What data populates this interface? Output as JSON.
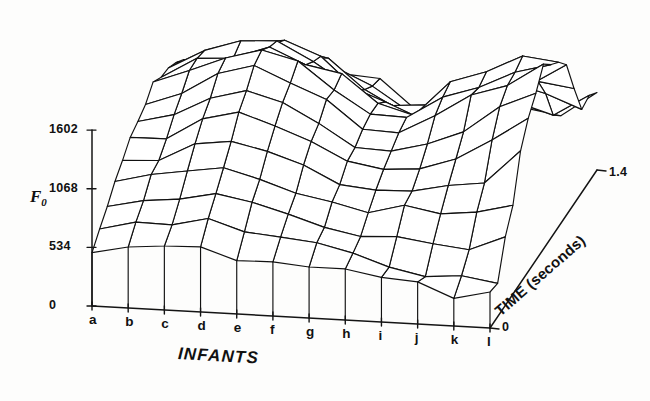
{
  "figure": {
    "type": "3d-wireframe-surface",
    "background_color": "#fdfdfc",
    "line_color": "#111111"
  },
  "axes": {
    "vertical": {
      "title": "F",
      "title_sub": "0",
      "title_full": "F0",
      "ticks": [
        "1602",
        "1068",
        "534",
        "0"
      ],
      "tick_values": [
        1602,
        1068,
        534,
        0
      ],
      "range": [
        0,
        1602
      ]
    },
    "depth": {
      "title": "TIME (seconds)",
      "ticks": [
        "0",
        "1.4"
      ],
      "tick_values": [
        0,
        1.4
      ],
      "range": [
        0,
        1.4
      ]
    },
    "horizontal": {
      "title": "INFANTS",
      "ticks": [
        "a",
        "b",
        "c",
        "d",
        "e",
        "f",
        "g",
        "h",
        "i",
        "j",
        "k",
        "l"
      ]
    }
  },
  "chart_data": {
    "type": "surface",
    "title": "",
    "xlabel": "INFANTS",
    "ylabel": "TIME (seconds)",
    "zlabel": "F0",
    "grid": false,
    "legend": "none",
    "x": [
      "a",
      "b",
      "c",
      "d",
      "e",
      "f",
      "g",
      "h",
      "i",
      "j",
      "k",
      "l"
    ],
    "y": [
      0,
      0.1,
      0.2,
      0.3,
      0.4,
      0.5,
      0.6,
      0.7,
      0.8,
      0.9,
      1.0,
      1.1,
      1.2,
      1.3,
      1.4
    ],
    "zlim": [
      0,
      1602
    ],
    "ylim": [
      0,
      1.4
    ],
    "z": [
      [
        510,
        640,
        700,
        820,
        900,
        980,
        1060,
        1120,
        1180,
        1200,
        1150,
        1080,
        980,
        880,
        760
      ],
      [
        520,
        660,
        760,
        880,
        960,
        1060,
        1180,
        1260,
        1320,
        1300,
        1240,
        1160,
        1040,
        920,
        800
      ],
      [
        540,
        700,
        820,
        960,
        1080,
        1200,
        1320,
        1420,
        1480,
        1440,
        1360,
        1260,
        1120,
        980,
        840
      ],
      [
        560,
        720,
        860,
        1000,
        1140,
        1280,
        1420,
        1520,
        1580,
        1520,
        1420,
        1300,
        1160,
        1000,
        860
      ],
      [
        530,
        680,
        800,
        940,
        1060,
        1180,
        1300,
        1400,
        1440,
        1380,
        1280,
        1160,
        1020,
        880,
        760
      ],
      [
        500,
        620,
        720,
        840,
        940,
        1040,
        1140,
        1220,
        1260,
        1200,
        1100,
        980,
        860,
        740,
        640
      ],
      [
        470,
        560,
        640,
        740,
        820,
        900,
        980,
        1040,
        1060,
        1000,
        900,
        800,
        700,
        600,
        520
      ],
      [
        440,
        520,
        600,
        700,
        790,
        880,
        960,
        1020,
        1040,
        980,
        880,
        780,
        680,
        580,
        500
      ],
      [
        400,
        470,
        560,
        680,
        800,
        920,
        1040,
        1160,
        1240,
        1180,
        1060,
        920,
        780,
        660,
        560
      ],
      [
        360,
        420,
        520,
        660,
        820,
        980,
        1140,
        1280,
        1380,
        1320,
        1180,
        1000,
        840,
        700,
        580
      ],
      [
        320,
        400,
        540,
        740,
        960,
        1160,
        1340,
        1460,
        1520,
        1440,
        1260,
        1060,
        880,
        720,
        600
      ],
      [
        280,
        380,
        580,
        860,
        1120,
        1340,
        1500,
        1590,
        1600,
        1500,
        1300,
        1080,
        880,
        720,
        600
      ]
    ]
  },
  "projection": {
    "origin_x": 92,
    "origin_y": 306,
    "x_axis_end_x": 490,
    "x_axis_end_y": 328,
    "depth_end_x": 597,
    "depth_end_y": 170,
    "vertical_top_y": 130,
    "vertical_scale": 0.1098
  }
}
